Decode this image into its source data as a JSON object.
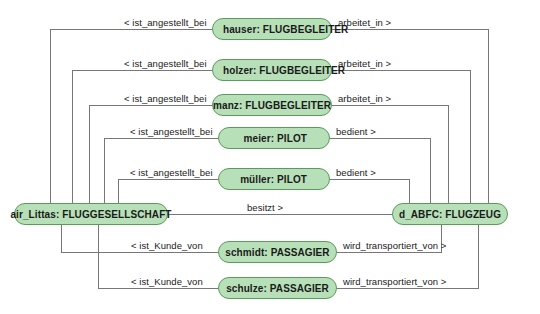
{
  "diagram": {
    "type": "object-diagram",
    "palette": {
      "node_fill": "#b8e0b8",
      "node_border": "#5a9a5a",
      "edge_stroke": "#777777",
      "text": "#1a1a1a",
      "background": "#ffffff"
    },
    "anchors": {
      "airline": "air_Littas: FLUGGESELLSCHAFT",
      "aircraft": "d_ABFC: FLUGZEUG"
    },
    "nodes": [
      {
        "id": "hauser",
        "label": "hauser: FLUGBEGLEITER",
        "align": "left"
      },
      {
        "id": "holzer",
        "label": "holzer: FLUGBEGLEITER",
        "align": "left"
      },
      {
        "id": "manz",
        "label": "manz: FLUGBEGLEITER",
        "align": "center"
      },
      {
        "id": "meier",
        "label": "meier: PILOT",
        "align": "right"
      },
      {
        "id": "mueller",
        "label": "müller: PILOT",
        "align": "right"
      },
      {
        "id": "airline",
        "label": "air_Littas: FLUGGESELLSCHAFT",
        "align": "center"
      },
      {
        "id": "aircraft",
        "label": "d_ABFC: FLUGZEUG",
        "align": "center"
      },
      {
        "id": "schmidt",
        "label": "schmidt: PASSAGIER",
        "align": "center"
      },
      {
        "id": "schulze",
        "label": "schulze: PASSAGIER",
        "align": "center"
      }
    ],
    "edge_labels": {
      "ist_angestellt_bei": "< ist_angestellt_bei",
      "arbeitet_in": "arbeitet_in >",
      "bedient": "bedient >",
      "besitzt": "besitzt >",
      "ist_Kunde_von": "< ist_Kunde_von",
      "wird_transportiert_von": "wird_transportiert_von >"
    },
    "edges": [
      {
        "from": "airline",
        "to": "hauser",
        "label": "< ist_angestellt_bei"
      },
      {
        "from": "hauser",
        "to": "aircraft",
        "label": "arbeitet_in >"
      },
      {
        "from": "airline",
        "to": "holzer",
        "label": "< ist_angestellt_bei"
      },
      {
        "from": "holzer",
        "to": "aircraft",
        "label": "arbeitet_in >"
      },
      {
        "from": "airline",
        "to": "manz",
        "label": "< ist_angestellt_bei"
      },
      {
        "from": "manz",
        "to": "aircraft",
        "label": "arbeitet_in >"
      },
      {
        "from": "airline",
        "to": "meier",
        "label": "< ist_angestellt_bei"
      },
      {
        "from": "meier",
        "to": "aircraft",
        "label": "bedient >"
      },
      {
        "from": "airline",
        "to": "mueller",
        "label": "< ist_angestellt_bei"
      },
      {
        "from": "mueller",
        "to": "aircraft",
        "label": "bedient >"
      },
      {
        "from": "airline",
        "to": "aircraft",
        "label": "besitzt >"
      },
      {
        "from": "airline",
        "to": "schmidt",
        "label": "< ist_Kunde_von"
      },
      {
        "from": "schmidt",
        "to": "aircraft",
        "label": "wird_transportiert_von >"
      },
      {
        "from": "airline",
        "to": "schulze",
        "label": "< ist_Kunde_von"
      },
      {
        "from": "schulze",
        "to": "aircraft",
        "label": "wird_transportiert_von >"
      }
    ]
  }
}
